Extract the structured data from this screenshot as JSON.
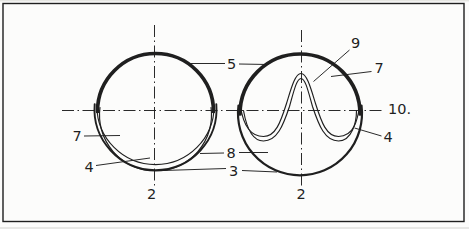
{
  "colors": {
    "ink": "#1f1f1f",
    "paper": "#fcfcfb"
  },
  "annotations": {
    "n5": "5",
    "n7_left": "7",
    "n4_left": "4",
    "n8": "8",
    "n3": "3",
    "n2_left": "2",
    "n9": "9",
    "n7_right": "7",
    "n10": "10.",
    "n4_right": "4",
    "n2_right": "2"
  }
}
